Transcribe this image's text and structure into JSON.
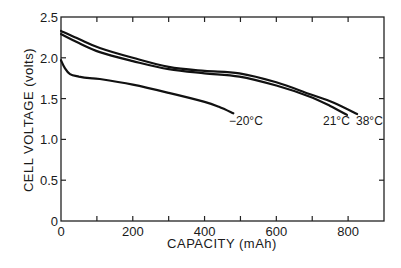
{
  "chart_data": {
    "type": "line",
    "title": "",
    "xlabel": "CAPACITY (mAh)",
    "ylabel": "CELL VOLTAGE (volts)",
    "xlim": [
      0,
      900
    ],
    "ylim": [
      0,
      2.5
    ],
    "x_ticks": [
      0,
      100,
      200,
      300,
      400,
      500,
      600,
      700,
      800,
      900
    ],
    "x_tick_labels": [
      "0",
      "",
      "200",
      "",
      "400",
      "",
      "600",
      "",
      "800",
      ""
    ],
    "y_ticks": [
      0,
      0.5,
      1.0,
      1.5,
      2.0,
      2.5
    ],
    "y_tick_labels": [
      "0",
      "0.5",
      "1.0",
      "1.5",
      "2.0",
      "2.5"
    ],
    "grid": false,
    "legend": "inline annotations at curve ends",
    "series": [
      {
        "name": "38°C",
        "label": "38°C",
        "x": [
          0,
          50,
          108,
          200,
          300,
          400,
          497,
          600,
          690,
          760,
          825
        ],
        "y": [
          2.33,
          2.23,
          2.12,
          2.0,
          1.89,
          1.84,
          1.81,
          1.7,
          1.56,
          1.45,
          1.31
        ]
      },
      {
        "name": "21°C",
        "label": "21°C",
        "x": [
          0,
          50,
          108,
          200,
          300,
          400,
          497,
          600,
          690,
          750,
          797
        ],
        "y": [
          2.29,
          2.18,
          2.07,
          1.96,
          1.86,
          1.81,
          1.77,
          1.66,
          1.53,
          1.41,
          1.3
        ]
      },
      {
        "name": "-20°C",
        "label": "−20°C",
        "x": [
          0,
          10,
          25,
          50,
          80,
          108,
          200,
          300,
          400,
          440,
          480
        ],
        "y": [
          1.97,
          1.88,
          1.8,
          1.77,
          1.75,
          1.74,
          1.67,
          1.57,
          1.46,
          1.4,
          1.32
        ]
      }
    ]
  },
  "labels": {
    "x_axis_title": "CAPACITY (mAh)",
    "y_axis_title": "CELL VOLTAGE (volts)",
    "annot_minus20": "−20°C",
    "annot_21": "21°C",
    "annot_38": "38°C"
  }
}
